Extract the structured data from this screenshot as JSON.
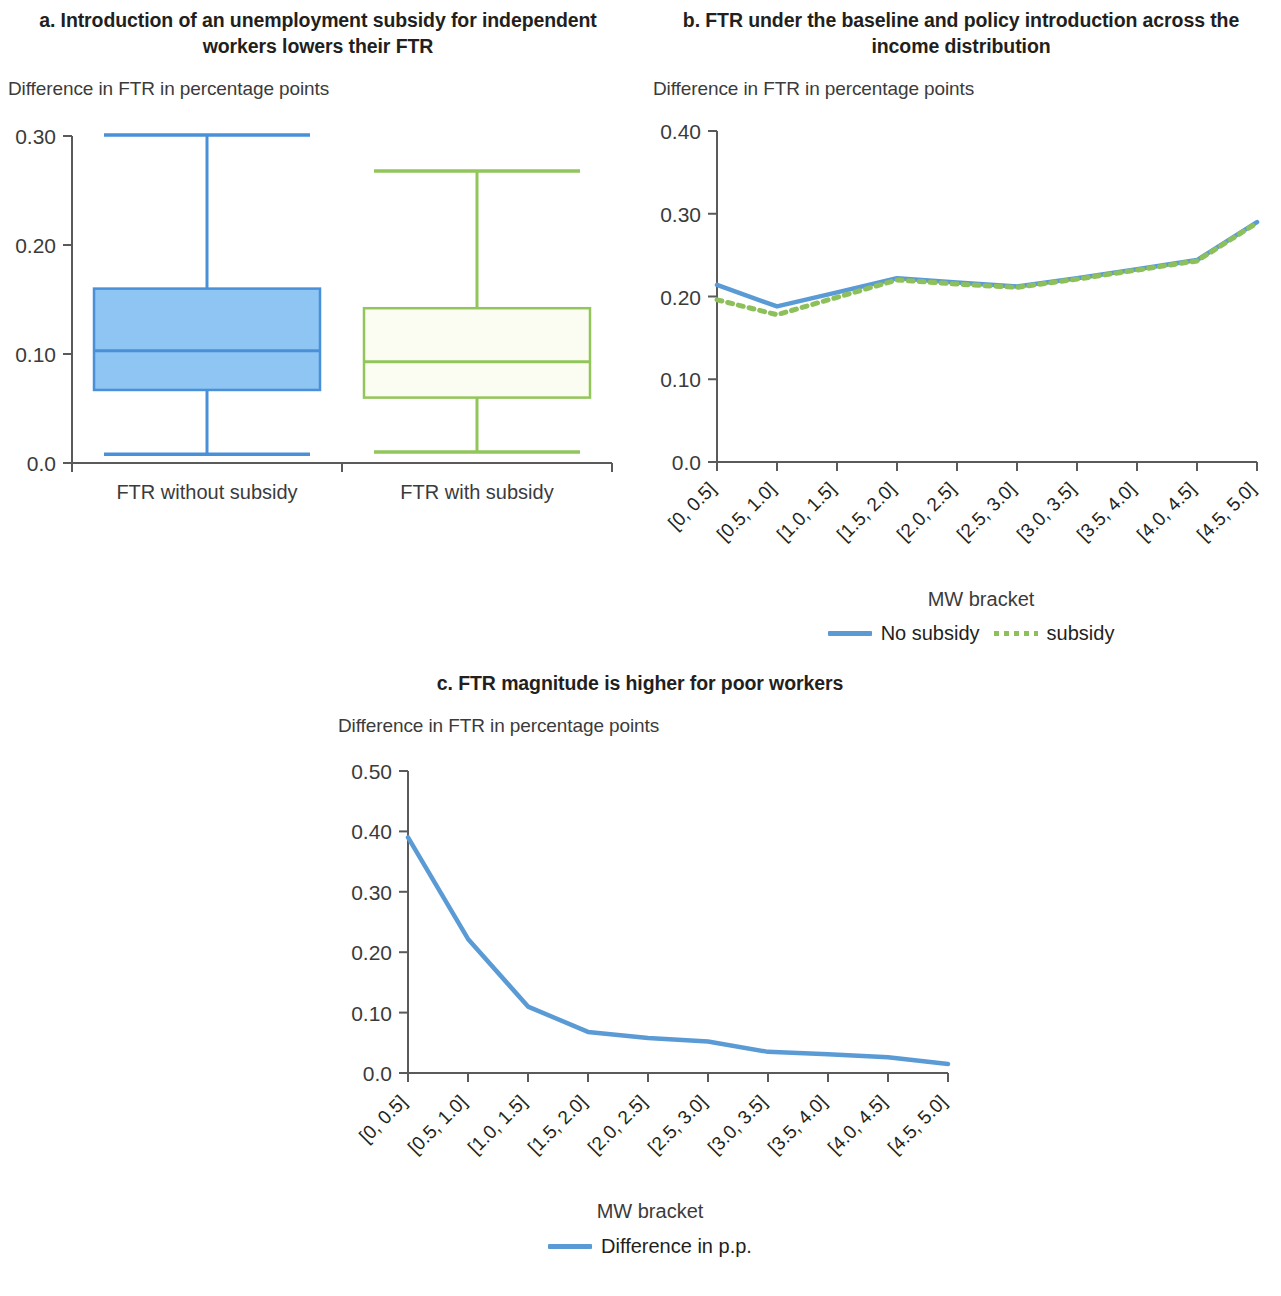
{
  "figure": {
    "shared_y_note": "Difference in FTR in percentage points",
    "x_axis_caption": "MW bracket"
  },
  "panel_a": {
    "title": "a. Introduction of an unemployment subsidy for independent workers lowers their FTR",
    "y_note": "Difference in FTR in percentage points",
    "y_ticks": [
      "0.30",
      "0.20",
      "0.10",
      "0.0"
    ],
    "categories": [
      "FTR without subsidy",
      "FTR with subsidy"
    ]
  },
  "panel_b": {
    "title": "b. FTR under the baseline and policy introduction across the income distribution",
    "y_note": "Difference in FTR in percentage points",
    "y_ticks": [
      "0.40",
      "0.30",
      "0.20",
      "0.10",
      "0.0"
    ],
    "x_caption": "MW bracket",
    "legend": [
      {
        "label": "No subsidy",
        "style": "solid",
        "color": "#5b9bd5"
      },
      {
        "label": "subsidy",
        "style": "dotted",
        "color": "#8dbf5a"
      }
    ]
  },
  "panel_c": {
    "title": "c. FTR magnitude is higher for poor workers",
    "y_note": "Difference in FTR in percentage points",
    "y_ticks": [
      "0.50",
      "0.40",
      "0.30",
      "0.20",
      "0.10",
      "0.0"
    ],
    "x_caption": "MW bracket",
    "legend": [
      {
        "label": "Difference in p.p.",
        "style": "solid",
        "color": "#5b9bd5"
      }
    ]
  },
  "chart_data": [
    {
      "panel": "a",
      "type": "box",
      "title": "a. Introduction of an unemployment subsidy for independent workers lowers their FTR",
      "xlabel": "",
      "ylabel": "Difference in FTR in percentage points",
      "ylim": [
        0.0,
        0.3
      ],
      "yticks": [
        0.0,
        0.1,
        0.2,
        0.3
      ],
      "grid": false,
      "categories": [
        "FTR without subsidy",
        "FTR with subsidy"
      ],
      "boxes": [
        {
          "name": "FTR without subsidy",
          "whisker_low": 0.008,
          "q1": 0.067,
          "median": 0.103,
          "q3": 0.16,
          "whisker_high": 0.301,
          "fill": "#8ec5f2",
          "stroke": "#4a90d9"
        },
        {
          "name": "FTR with subsidy",
          "whisker_low": 0.01,
          "q1": 0.06,
          "median": 0.093,
          "q3": 0.142,
          "whisker_high": 0.268,
          "fill": "#fcfdf2",
          "stroke": "#92c65a"
        }
      ]
    },
    {
      "panel": "b",
      "type": "line",
      "title": "b. FTR under the baseline and policy introduction across the income distribution",
      "xlabel": "MW bracket",
      "ylabel": "Difference in FTR in percentage points",
      "ylim": [
        0.0,
        0.4
      ],
      "yticks": [
        0.0,
        0.1,
        0.2,
        0.3,
        0.4
      ],
      "grid": false,
      "legend_position": "bottom",
      "categories": [
        "[0, 0.5]",
        "[0.5, 1.0]",
        "[1.0, 1.5]",
        "[1.5, 2.0]",
        "[2.0, 2.5]",
        "[2.5, 3.0]",
        "[3.0, 3.5]",
        "[3.5, 4.0]",
        "[4.0, 4.5]",
        "[4.5, 5.0]"
      ],
      "series": [
        {
          "name": "No subsidy",
          "style": "solid",
          "color": "#5b9bd5",
          "values": [
            0.214,
            0.188,
            0.205,
            0.222,
            0.217,
            0.212,
            0.222,
            0.233,
            0.244,
            0.29
          ]
        },
        {
          "name": "subsidy",
          "style": "dotted",
          "color": "#8dbf5a",
          "values": [
            0.196,
            0.178,
            0.199,
            0.22,
            0.215,
            0.211,
            0.221,
            0.232,
            0.243,
            0.289
          ]
        }
      ]
    },
    {
      "panel": "c",
      "type": "line",
      "title": "c. FTR magnitude is higher for poor workers",
      "xlabel": "MW bracket",
      "ylabel": "Difference in FTR in percentage points",
      "ylim": [
        0.0,
        0.5
      ],
      "yticks": [
        0.0,
        0.1,
        0.2,
        0.3,
        0.4,
        0.5
      ],
      "grid": false,
      "legend_position": "bottom",
      "categories": [
        "[0, 0.5]",
        "[0.5, 1.0]",
        "[1.0, 1.5]",
        "[1.5, 2.0]",
        "[2.0, 2.5]",
        "[2.5, 3.0]",
        "[3.0, 3.5]",
        "[3.5, 4.0]",
        "[4.0, 4.5]",
        "[4.5, 5.0]"
      ],
      "series": [
        {
          "name": "Difference in p.p.",
          "style": "solid",
          "color": "#5b9bd5",
          "values": [
            0.39,
            0.222,
            0.11,
            0.068,
            0.058,
            0.052,
            0.035,
            0.031,
            0.026,
            0.015
          ]
        }
      ]
    }
  ]
}
